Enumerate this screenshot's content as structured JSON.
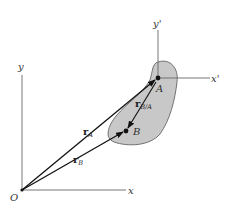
{
  "diagram": {
    "type": "relative-position-vectors",
    "colors": {
      "body_fill": "#c8c8c8",
      "body_stroke": "#555555",
      "axis": "#666666",
      "vector": "#111111"
    },
    "fixed_frame": {
      "origin_label": "O",
      "x_label": "x",
      "y_label": "y"
    },
    "translating_frame": {
      "origin_point": "A",
      "x_label": "x'",
      "y_label": "y'"
    },
    "points": [
      {
        "label": "A"
      },
      {
        "label": "B"
      }
    ],
    "vectors": [
      {
        "name": "r",
        "sub": "A",
        "from": "O",
        "to": "A"
      },
      {
        "name": "r",
        "sub": "B",
        "from": "O",
        "to": "B"
      },
      {
        "name": "r",
        "sub": "B/A",
        "from": "A",
        "to": "B"
      }
    ]
  }
}
